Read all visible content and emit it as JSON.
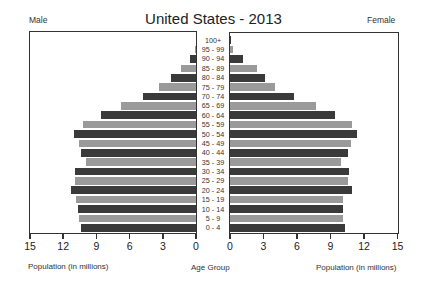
{
  "header": {
    "title": "United States - 2013",
    "left_label": "Male",
    "right_label": "Female"
  },
  "axes": {
    "left_title": "Population (in millions)",
    "center_title": "Age Group",
    "right_title": "Population (in millions)",
    "left_ticks": [
      "15",
      "12",
      "9",
      "6",
      "3",
      "0"
    ],
    "right_ticks": [
      "0",
      "3",
      "6",
      "9",
      "12",
      "15"
    ]
  },
  "colors": {
    "dark_bar": "#3a3a3a",
    "light_bar": "#9a9a9a",
    "frame": "#333333"
  },
  "chart_data": {
    "type": "bar",
    "subtype": "population-pyramid",
    "title": "United States - 2013",
    "xlabel": "Population (in millions)",
    "ylabel": "Age Group",
    "xlim": [
      0,
      15
    ],
    "grid": false,
    "legend": "none (Male left, Female right labels)",
    "categories": [
      "100+",
      "95 - 99",
      "90 - 94",
      "85 - 89",
      "80 - 84",
      "75 - 79",
      "70 - 74",
      "65 - 69",
      "60 - 64",
      "55 - 59",
      "50 - 54",
      "45 - 49",
      "40 - 44",
      "35 - 39",
      "30 - 34",
      "25 - 29",
      "20 - 24",
      "15 - 19",
      "10 - 14",
      "5 - 9",
      "0 - 4"
    ],
    "series": [
      {
        "name": "Male",
        "values": [
          0.0,
          0.1,
          0.5,
          1.4,
          2.3,
          3.3,
          4.8,
          6.8,
          8.6,
          10.2,
          11.0,
          10.6,
          10.4,
          9.9,
          10.9,
          10.9,
          11.3,
          10.8,
          10.7,
          10.6,
          10.4
        ]
      },
      {
        "name": "Female",
        "values": [
          0.05,
          0.3,
          1.2,
          2.4,
          3.1,
          4.0,
          5.7,
          7.7,
          9.4,
          10.9,
          11.4,
          10.8,
          10.6,
          9.9,
          10.7,
          10.6,
          10.9,
          10.1,
          10.1,
          10.1,
          10.3
        ]
      }
    ]
  }
}
